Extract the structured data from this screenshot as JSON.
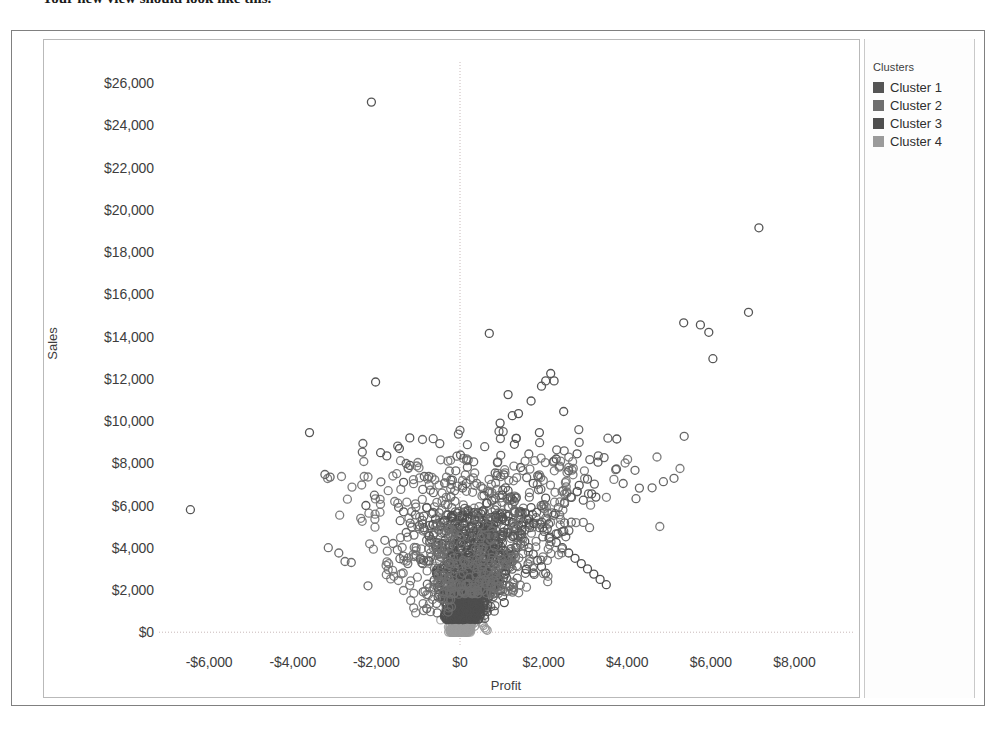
{
  "caption": {
    "text": "Your new view should look like this."
  },
  "chart_data": {
    "type": "scatter",
    "title": "",
    "xlabel": "Profit",
    "ylabel": "Sales",
    "xlim": [
      -7200,
      9400
    ],
    "ylim": [
      -700,
      27000
    ],
    "xticks": [
      -6000,
      -4000,
      -2000,
      0,
      2000,
      4000,
      6000,
      8000
    ],
    "xticklabels": [
      "-$6,000",
      "-$4,000",
      "-$2,000",
      "$0",
      "$2,000",
      "$4,000",
      "$6,000",
      "$8,000"
    ],
    "yticks": [
      0,
      2000,
      4000,
      6000,
      8000,
      10000,
      12000,
      14000,
      16000,
      18000,
      20000,
      22000,
      24000,
      26000
    ],
    "yticklabels": [
      "$0",
      "$2,000",
      "$4,000",
      "$6,000",
      "$8,000",
      "$10,000",
      "$12,000",
      "$14,000",
      "$16,000",
      "$18,000",
      "$20,000",
      "$22,000",
      "$24,000",
      "$26,000"
    ],
    "grid": true,
    "gridlines": {
      "x_at": [
        0
      ],
      "y_at": [
        0
      ],
      "style": "dotted",
      "color": "#c8b9b9"
    },
    "marker": {
      "shape": "open-circle",
      "size": 8,
      "stroke_width": 1.3,
      "fill": "none"
    },
    "legend": {
      "position": "right",
      "title": "Clusters"
    },
    "series": [
      {
        "name": "Cluster 1",
        "color": "#555555",
        "points": [
          [
            -2120,
            25100
          ],
          [
            7150,
            19150
          ],
          [
            6900,
            15150
          ],
          [
            5350,
            14650
          ],
          [
            5750,
            14550
          ],
          [
            5950,
            14200
          ],
          [
            700,
            14150
          ],
          [
            6050,
            12950
          ],
          [
            -2020,
            11850
          ],
          [
            2170,
            12250
          ],
          [
            2050,
            11900
          ],
          [
            1950,
            11650
          ],
          [
            2250,
            11900
          ],
          [
            1150,
            11250
          ],
          [
            1700,
            10950
          ],
          [
            2480,
            10450
          ],
          [
            1400,
            10350
          ],
          [
            1250,
            10250
          ],
          [
            -3600,
            9450
          ],
          [
            960,
            9900
          ],
          [
            3750,
            9150
          ],
          [
            1900,
            9450
          ],
          [
            -1200,
            9200
          ],
          [
            1300,
            8900
          ],
          [
            -1450,
            8700
          ],
          [
            -1900,
            8500
          ],
          [
            -1750,
            8350
          ],
          [
            2800,
            8450
          ],
          [
            2300,
            8200
          ],
          [
            3300,
            8050
          ],
          [
            -1200,
            7900
          ],
          [
            1450,
            7800
          ],
          [
            2600,
            7650
          ],
          [
            3050,
            7250
          ],
          [
            1050,
            7450
          ],
          [
            -1350,
            7100
          ],
          [
            1750,
            7050
          ],
          [
            2850,
            6950
          ],
          [
            1150,
            6700
          ],
          [
            3150,
            6550
          ],
          [
            3250,
            6400
          ],
          [
            2950,
            6250
          ],
          [
            -6450,
            5800
          ],
          [
            -2250,
            6000
          ],
          [
            -1350,
            5700
          ],
          [
            1250,
            6300
          ],
          [
            650,
            6100
          ],
          [
            2050,
            6350
          ],
          [
            2500,
            6100
          ],
          [
            1700,
            5900
          ]
        ]
      },
      {
        "name": "Cluster 2",
        "color": "#6e6e6e",
        "points": [
          [
            -3150,
            4000
          ],
          [
            -2900,
            3750
          ],
          [
            -2750,
            3350
          ],
          [
            -2600,
            3300
          ],
          [
            -2200,
            2200
          ],
          [
            -1800,
            4350
          ],
          [
            -1600,
            4200
          ],
          [
            -1500,
            3900
          ],
          [
            -1350,
            3600
          ],
          [
            -1250,
            3250
          ],
          [
            -1100,
            4600
          ],
          [
            -1050,
            4000
          ],
          [
            -950,
            3450
          ],
          [
            -900,
            5300
          ],
          [
            -850,
            4850
          ],
          [
            -800,
            4350
          ],
          [
            -750,
            3950
          ],
          [
            -700,
            3550
          ],
          [
            -650,
            5100
          ],
          [
            -620,
            4700
          ],
          [
            -580,
            4250
          ],
          [
            -540,
            3800
          ],
          [
            -500,
            5650
          ],
          [
            -470,
            5200
          ],
          [
            -440,
            4700
          ],
          [
            -410,
            4200
          ],
          [
            -380,
            3700
          ],
          [
            -350,
            6050
          ],
          [
            -320,
            5550
          ],
          [
            -300,
            5050
          ],
          [
            -280,
            4550
          ],
          [
            -260,
            4050
          ],
          [
            -240,
            3550
          ],
          [
            -220,
            6400
          ],
          [
            -200,
            5900
          ],
          [
            -190,
            5400
          ],
          [
            -180,
            4900
          ],
          [
            -170,
            4400
          ],
          [
            -160,
            3900
          ],
          [
            -150,
            3400
          ],
          [
            -140,
            2900
          ],
          [
            -130,
            6700
          ],
          [
            -120,
            6200
          ],
          [
            -110,
            5700
          ],
          [
            -100,
            5200
          ],
          [
            -95,
            4700
          ],
          [
            -90,
            4200
          ],
          [
            -85,
            3700
          ],
          [
            -80,
            3200
          ],
          [
            -75,
            2700
          ],
          [
            -70,
            2200
          ],
          [
            400,
            7050
          ],
          [
            550,
            6800
          ],
          [
            700,
            6600
          ],
          [
            850,
            6350
          ],
          [
            1000,
            6150
          ],
          [
            1150,
            5950
          ],
          [
            1300,
            5750
          ],
          [
            1450,
            5550
          ],
          [
            1600,
            5350
          ],
          [
            1750,
            5150
          ],
          [
            1900,
            4950
          ],
          [
            2050,
            5400
          ],
          [
            2200,
            5650
          ],
          [
            2350,
            5900
          ],
          [
            2500,
            6150
          ],
          [
            2650,
            6400
          ],
          [
            2800,
            6650
          ],
          [
            2950,
            5200
          ],
          [
            3100,
            4950
          ]
        ]
      },
      {
        "name": "Cluster 3",
        "color": "#4f4f4f",
        "points": [
          [
            -60,
            5100
          ],
          [
            -55,
            4800
          ],
          [
            -50,
            4500
          ],
          [
            -45,
            4200
          ],
          [
            -40,
            3900
          ],
          [
            -38,
            3600
          ],
          [
            -36,
            3300
          ],
          [
            -34,
            3000
          ],
          [
            -32,
            2700
          ],
          [
            -30,
            2400
          ],
          [
            -28,
            2100
          ],
          [
            -26,
            1800
          ],
          [
            -24,
            1500
          ],
          [
            -22,
            1200
          ],
          [
            -20,
            900
          ],
          [
            60,
            5400
          ],
          [
            80,
            5150
          ],
          [
            100,
            4900
          ],
          [
            120,
            4650
          ],
          [
            140,
            4400
          ],
          [
            160,
            4150
          ],
          [
            180,
            3900
          ],
          [
            200,
            3650
          ],
          [
            220,
            3400
          ],
          [
            240,
            3150
          ],
          [
            260,
            2900
          ],
          [
            280,
            2650
          ],
          [
            300,
            2400
          ],
          [
            320,
            2150
          ],
          [
            340,
            1900
          ],
          [
            360,
            1650
          ],
          [
            380,
            1400
          ],
          [
            400,
            1150
          ],
          [
            420,
            900
          ],
          [
            440,
            650
          ],
          [
            500,
            5600
          ],
          [
            540,
            5300
          ],
          [
            580,
            5000
          ],
          [
            620,
            4700
          ],
          [
            660,
            4400
          ],
          [
            700,
            4100
          ],
          [
            740,
            3800
          ],
          [
            780,
            3500
          ],
          [
            820,
            3200
          ],
          [
            860,
            2900
          ],
          [
            900,
            2600
          ],
          [
            940,
            2300
          ],
          [
            980,
            2000
          ],
          [
            1020,
            1700
          ],
          [
            1060,
            1400
          ],
          [
            1150,
            5500
          ],
          [
            1250,
            5200
          ],
          [
            1350,
            4900
          ],
          [
            1450,
            4600
          ],
          [
            1550,
            4300
          ],
          [
            1650,
            4000
          ],
          [
            1750,
            3700
          ],
          [
            1850,
            3400
          ],
          [
            1950,
            3100
          ],
          [
            2050,
            2800
          ],
          [
            2150,
            4500
          ],
          [
            2300,
            4250
          ],
          [
            2450,
            4000
          ],
          [
            2600,
            3750
          ],
          [
            2750,
            3500
          ],
          [
            2900,
            3250
          ],
          [
            3050,
            3000
          ],
          [
            3200,
            2750
          ],
          [
            3350,
            2500
          ],
          [
            3500,
            2250
          ]
        ]
      },
      {
        "name": "Cluster 4",
        "color": "#9b9b9b",
        "points": [
          [
            -30,
            2000
          ],
          [
            -28,
            1800
          ],
          [
            -26,
            1600
          ],
          [
            -24,
            1400
          ],
          [
            -22,
            1200
          ],
          [
            -20,
            1000
          ],
          [
            -18,
            800
          ],
          [
            -16,
            600
          ],
          [
            -14,
            400
          ],
          [
            -12,
            250
          ],
          [
            -10,
            150
          ],
          [
            -8,
            100
          ],
          [
            -6,
            80
          ],
          [
            -4,
            60
          ],
          [
            -2,
            40
          ],
          [
            10,
            2100
          ],
          [
            20,
            1900
          ],
          [
            30,
            1700
          ],
          [
            40,
            1500
          ],
          [
            50,
            1300
          ],
          [
            60,
            1100
          ],
          [
            70,
            900
          ],
          [
            80,
            700
          ],
          [
            90,
            500
          ],
          [
            100,
            350
          ],
          [
            110,
            250
          ],
          [
            120,
            180
          ],
          [
            130,
            120
          ],
          [
            140,
            80
          ],
          [
            150,
            50
          ],
          [
            -90,
            2300
          ],
          [
            -80,
            2050
          ],
          [
            -70,
            1850
          ],
          [
            -60,
            1650
          ],
          [
            -50,
            1450
          ],
          [
            -45,
            1250
          ],
          [
            -40,
            1050
          ],
          [
            -35,
            850
          ],
          [
            -30,
            650
          ],
          [
            -25,
            450
          ],
          [
            170,
            2250
          ],
          [
            190,
            2000
          ],
          [
            210,
            1750
          ],
          [
            230,
            1500
          ],
          [
            250,
            1250
          ],
          [
            270,
            1000
          ],
          [
            290,
            800
          ],
          [
            310,
            600
          ],
          [
            330,
            420
          ],
          [
            350,
            280
          ],
          [
            -130,
            1900
          ],
          [
            -115,
            1650
          ],
          [
            -105,
            1400
          ],
          [
            -95,
            1150
          ],
          [
            -88,
            900
          ],
          [
            -78,
            680
          ],
          [
            -68,
            480
          ],
          [
            -58,
            320
          ],
          [
            -48,
            200
          ],
          [
            -38,
            120
          ],
          [
            380,
            1600
          ],
          [
            410,
            1350
          ],
          [
            440,
            1100
          ],
          [
            470,
            880
          ],
          [
            500,
            660
          ],
          [
            530,
            470
          ],
          [
            560,
            320
          ],
          [
            590,
            210
          ],
          [
            620,
            140
          ],
          [
            650,
            90
          ]
        ]
      }
    ]
  },
  "legend": {
    "title": "Clusters",
    "items": [
      {
        "label": "Cluster 1",
        "color": "#555555"
      },
      {
        "label": "Cluster 2",
        "color": "#6e6e6e"
      },
      {
        "label": "Cluster 3",
        "color": "#4f4f4f"
      },
      {
        "label": "Cluster 4",
        "color": "#9b9b9b"
      }
    ]
  }
}
